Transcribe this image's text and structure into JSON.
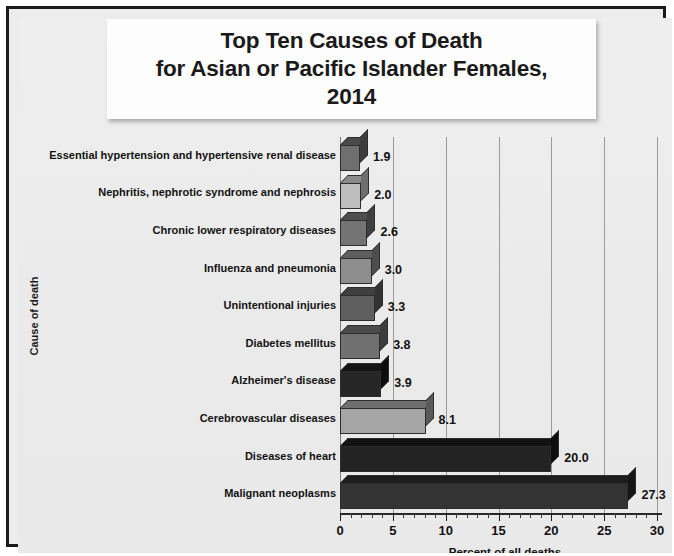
{
  "figure": {
    "title": "Top Ten Causes of Death\nfor Asian or Pacific Islander Females,\n2014",
    "title_line1": "Top Ten Causes of Death",
    "title_line2": "for Asian or Pacific Islander Females,",
    "title_line3": "2014",
    "frame_color": "#1b1b1b",
    "background_color": "#eaeaea"
  },
  "chart_data": {
    "type": "bar",
    "orientation": "horizontal",
    "title": "Top Ten Causes of Death for Asian or Pacific Islander Females, 2014",
    "xlabel": "Percent of all deaths",
    "ylabel": "Cause of death",
    "xlim": [
      0,
      30
    ],
    "xticks": [
      0,
      5,
      10,
      15,
      20,
      25,
      30
    ],
    "xtick_labels": [
      "0",
      "5",
      "10",
      "15",
      "20",
      "25",
      "30"
    ],
    "minor_tick_step": 1,
    "grid": "vertical",
    "legend": "none",
    "categories": [
      "Essential hypertension and hypertensive renal disease",
      "Nephritis, nephrotic syndrome and nephrosis",
      "Chronic lower respiratory diseases",
      "Influenza and pneumonia",
      "Unintentional injuries",
      "Diabetes mellitus",
      "Alzheimer's disease",
      "Cerebrovascular diseases",
      "Diseases of heart",
      "Malignant neoplasms"
    ],
    "values": [
      1.9,
      2.0,
      2.6,
      3.0,
      3.3,
      3.8,
      3.9,
      8.1,
      20.0,
      27.3
    ],
    "value_labels": [
      "1.9",
      "2.0",
      "2.6",
      "3.0",
      "3.3",
      "3.8",
      "3.9",
      "8.1",
      "20.0",
      "27.3"
    ],
    "bar_colors": [
      "#6f6f6f",
      "#bdbdbd",
      "#747474",
      "#8d8d8d",
      "#5f5f5f",
      "#707070",
      "#262626",
      "#a5a5a5",
      "#232323",
      "#333333"
    ],
    "bar_top_colors": [
      "#4a4a4a",
      "#8a8a8a",
      "#4e4e4e",
      "#5f5f5f",
      "#3f3f3f",
      "#4b4b4b",
      "#141414",
      "#6f6f6f",
      "#131313",
      "#1d1d1d"
    ],
    "bar_side_colors": [
      "#3c3c3c",
      "#6e6e6e",
      "#3f3f3f",
      "#4d4d4d",
      "#333333",
      "#3c3c3c",
      "#0d0d0d",
      "#5a5a5a",
      "#0d0d0d",
      "#151515"
    ]
  }
}
